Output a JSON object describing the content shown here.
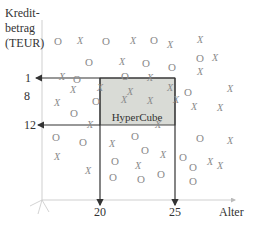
{
  "axes": {
    "y_label_lines": [
      "Kredit-",
      "betrag",
      "(TEUR)"
    ],
    "x_label": "Alter",
    "y_tick_upper_lines": [
      "1",
      "8"
    ],
    "y_tick_lower": "12",
    "x_tick_left": "20",
    "x_tick_right": "25"
  },
  "hypercube": {
    "label": "HyperCube",
    "fill": "#d9dbd6",
    "border": "#444444"
  },
  "colors": {
    "axis": "#cccccc",
    "arrow": "#333333",
    "symbol": "#8a8a8a"
  },
  "symbols": [
    {
      "t": "O",
      "x": 58,
      "y": 41
    },
    {
      "t": "X",
      "x": 80,
      "y": 41
    },
    {
      "t": "O",
      "x": 106,
      "y": 41
    },
    {
      "t": "X",
      "x": 133,
      "y": 41
    },
    {
      "t": "O",
      "x": 154,
      "y": 40
    },
    {
      "t": "X",
      "x": 170,
      "y": 45
    },
    {
      "t": "X",
      "x": 200,
      "y": 40
    },
    {
      "t": "O",
      "x": 89,
      "y": 62
    },
    {
      "t": "X",
      "x": 122,
      "y": 62
    },
    {
      "t": "O",
      "x": 146,
      "y": 63
    },
    {
      "t": "O",
      "x": 172,
      "y": 67
    },
    {
      "t": "O",
      "x": 200,
      "y": 58
    },
    {
      "t": "X",
      "x": 215,
      "y": 58
    },
    {
      "t": "X",
      "x": 62,
      "y": 77
    },
    {
      "t": "O",
      "x": 77,
      "y": 79
    },
    {
      "t": "O",
      "x": 125,
      "y": 76
    },
    {
      "t": "X",
      "x": 150,
      "y": 78
    },
    {
      "t": "X",
      "x": 200,
      "y": 72
    },
    {
      "t": "X",
      "x": 73,
      "y": 90
    },
    {
      "t": "X",
      "x": 100,
      "y": 88
    },
    {
      "t": "X",
      "x": 130,
      "y": 92
    },
    {
      "t": "X",
      "x": 170,
      "y": 88
    },
    {
      "t": "O",
      "x": 188,
      "y": 92
    },
    {
      "t": "X",
      "x": 230,
      "y": 89
    },
    {
      "t": "X",
      "x": 57,
      "y": 103
    },
    {
      "t": "O",
      "x": 74,
      "y": 113
    },
    {
      "t": "O",
      "x": 96,
      "y": 101
    },
    {
      "t": "X",
      "x": 124,
      "y": 100
    },
    {
      "t": "X",
      "x": 150,
      "y": 101
    },
    {
      "t": "X",
      "x": 176,
      "y": 100
    },
    {
      "t": "X",
      "x": 194,
      "y": 107
    },
    {
      "t": "X",
      "x": 220,
      "y": 108
    },
    {
      "t": "X",
      "x": 90,
      "y": 125
    },
    {
      "t": "X",
      "x": 158,
      "y": 125
    },
    {
      "t": "O",
      "x": 56,
      "y": 137
    },
    {
      "t": "O",
      "x": 83,
      "y": 142
    },
    {
      "t": "X",
      "x": 112,
      "y": 144
    },
    {
      "t": "O",
      "x": 135,
      "y": 136
    },
    {
      "t": "O",
      "x": 145,
      "y": 150
    },
    {
      "t": "X",
      "x": 163,
      "y": 155
    },
    {
      "t": "O",
      "x": 183,
      "y": 157
    },
    {
      "t": "O",
      "x": 200,
      "y": 138
    },
    {
      "t": "X",
      "x": 230,
      "y": 141
    },
    {
      "t": "X",
      "x": 57,
      "y": 157
    },
    {
      "t": "O",
      "x": 115,
      "y": 161
    },
    {
      "t": "X",
      "x": 138,
      "y": 166
    },
    {
      "t": "O",
      "x": 193,
      "y": 167
    },
    {
      "t": "X",
      "x": 210,
      "y": 162
    },
    {
      "t": "X",
      "x": 220,
      "y": 166
    },
    {
      "t": "X",
      "x": 88,
      "y": 171
    },
    {
      "t": "O",
      "x": 113,
      "y": 177
    },
    {
      "t": "O",
      "x": 141,
      "y": 179
    },
    {
      "t": "O",
      "x": 161,
      "y": 174
    },
    {
      "t": "O",
      "x": 193,
      "y": 181
    }
  ]
}
